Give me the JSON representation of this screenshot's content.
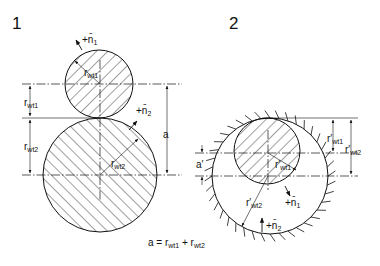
{
  "figure_1": {
    "label": "1",
    "pinion": {
      "speed_label": "+n̄",
      "speed_sub": "1",
      "radius_label": "r",
      "radius_sub": "wt1"
    },
    "gear": {
      "speed_label": "+n̄",
      "speed_sub": "2",
      "radius_label": "r",
      "radius_sub": "wt2"
    },
    "dim_left_top": {
      "label": "r",
      "sub": "wt1"
    },
    "dim_left_bottom": {
      "label": "r",
      "sub": "wt2"
    },
    "dim_right": {
      "label": "a"
    },
    "formula": {
      "lhs": "a = r",
      "sub1": "wt1",
      "mid": " + r",
      "sub2": "wt2"
    }
  },
  "figure_2": {
    "label": "2",
    "pinion": {
      "speed_label": "+n̄",
      "speed_sub": "1",
      "radius_label": "r′",
      "radius_sub": "wt1"
    },
    "ring_gear": {
      "speed_label": "+n̄",
      "speed_sub": "2",
      "radius_label": "r′",
      "radius_sub": "wt2"
    },
    "dim_left": {
      "label": "a′"
    },
    "dim_right_inner": {
      "label": "r′",
      "sub": "wt1"
    },
    "dim_right_outer": {
      "label": "r′",
      "sub": "wt2"
    }
  }
}
